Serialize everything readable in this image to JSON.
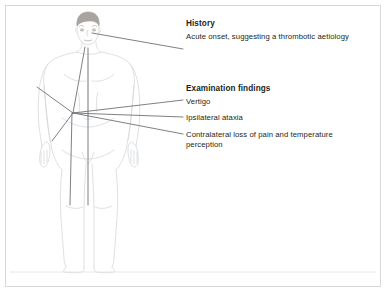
{
  "panel": {
    "border_color": "#d8d8d8",
    "background": "#ffffff",
    "text_color": "#231f20"
  },
  "illustration": {
    "name": "anterior-view-standing-male-figure",
    "outline_color": "#d6d8dc",
    "hair_color": "#a9a49f",
    "skin_color": "#fdfdfd",
    "leader_line_color": "#6f7276",
    "ground_line_color": "#e2e2e2"
  },
  "annotations": {
    "history": {
      "heading": "History",
      "body": "Acute onset, suggesting a thrombotic aetiology"
    },
    "examination": {
      "heading": "Examination findings",
      "items": [
        "Vertigo",
        "Ipsilateral ataxia",
        "Contralateral loss of pain and temperature perception"
      ]
    }
  }
}
